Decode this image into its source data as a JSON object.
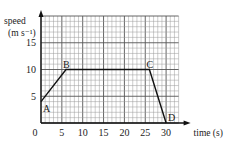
{
  "chart_data": {
    "type": "line",
    "title": "",
    "xlabel": "time (s)",
    "ylabel": "speed",
    "ylabel_unit": "(m s⁻¹)",
    "x": [
      0,
      6,
      26,
      30
    ],
    "values": [
      4,
      10,
      10,
      0
    ],
    "points": [
      {
        "label": "A",
        "x": 0,
        "y": 4
      },
      {
        "label": "B",
        "x": 6,
        "y": 10
      },
      {
        "label": "C",
        "x": 26,
        "y": 10
      },
      {
        "label": "D",
        "x": 30,
        "y": 0
      }
    ],
    "xticks": [
      "0",
      "5",
      "10",
      "15",
      "20",
      "25",
      "30"
    ],
    "yticks": [
      "5",
      "10",
      "15"
    ],
    "xlim": [
      0,
      33
    ],
    "ylim": [
      0,
      20
    ],
    "grid": true,
    "grid_minor_step": 1,
    "grid_major_step": 5,
    "legend": null
  }
}
